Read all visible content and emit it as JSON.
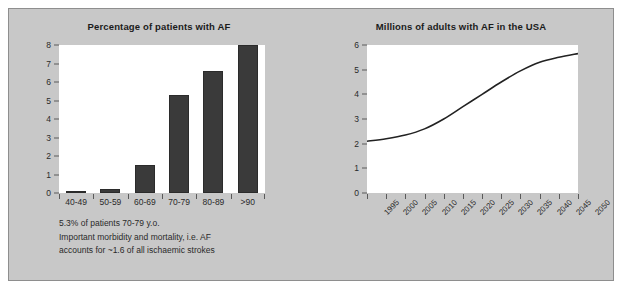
{
  "panel": {
    "background_color": "#c8c8c8",
    "border_color": "#8e8e8e"
  },
  "bar_chart": {
    "title": "Percentage of patients with AF",
    "caption": [
      "5.3% of patients 70-79 y.o.",
      "Important morbidity and mortality, i.e. AF",
      "accounts for ~1.6 of all ischaemic strokes"
    ]
  },
  "line_chart": {
    "title": "Millions of adults with AF in the USA"
  },
  "chart_data": [
    {
      "type": "bar",
      "title": "Percentage of patients with AF",
      "xlabel": "",
      "ylabel": "",
      "categories": [
        "40-49",
        "50-59",
        "60-69",
        "70-79",
        "80-89",
        ">90"
      ],
      "values": [
        0.13,
        0.22,
        1.5,
        5.3,
        6.6,
        8.0
      ],
      "ylim": [
        0,
        8
      ],
      "yticks": [
        0,
        1,
        2,
        3,
        4,
        5,
        6,
        7,
        8
      ],
      "grid": false,
      "legend": null,
      "bar_color": "#3a3a3a",
      "plot_background": "#ffffff"
    },
    {
      "type": "line",
      "title": "Millions of adults with AF in the USA",
      "xlabel": "",
      "ylabel": "",
      "x": [
        1995,
        2000,
        2005,
        2010,
        2015,
        2020,
        2025,
        2030,
        2035,
        2040,
        2045,
        2050
      ],
      "xtick_labels": [
        "1995",
        "2000",
        "2005",
        "2010",
        "2015",
        "2020",
        "2025",
        "2030",
        "2035",
        "2040",
        "2045",
        "2050"
      ],
      "series": [
        {
          "name": "Adults with AF (millions)",
          "values": [
            2.1,
            2.2,
            2.35,
            2.6,
            3.0,
            3.5,
            4.0,
            4.5,
            4.95,
            5.3,
            5.5,
            5.65
          ]
        }
      ],
      "ylim": [
        0,
        6
      ],
      "yticks": [
        0,
        1,
        2,
        3,
        4,
        5,
        6
      ],
      "grid": false,
      "legend": null,
      "line_color": "#222222",
      "plot_background": "#ffffff"
    }
  ]
}
